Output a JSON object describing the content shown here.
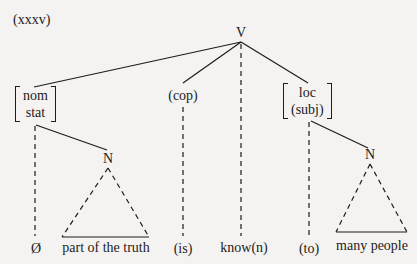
{
  "example_number": "(xxxv)",
  "tree": {
    "root": {
      "label": "V"
    },
    "children": [
      {
        "id": "nom-stat",
        "features": [
          "nom",
          "stat"
        ],
        "leaf": "Ø",
        "noun": {
          "label": "N",
          "leaf": "part of the truth"
        }
      },
      {
        "id": "cop",
        "label": "(cop)",
        "leaf": "(is)"
      },
      {
        "id": "verb",
        "leaf": "know(n)"
      },
      {
        "id": "loc-subj",
        "features": [
          "loc",
          "(subj)"
        ],
        "leaf": "(to)",
        "noun": {
          "label": "N",
          "leaf": "many people"
        }
      }
    ]
  },
  "line_color": "#1c1c1c",
  "background_color": "#f4f3f1"
}
